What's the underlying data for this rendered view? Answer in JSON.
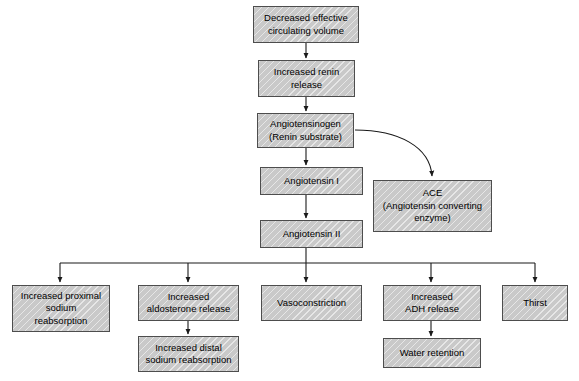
{
  "diagram": {
    "colors": {
      "node_fill": "#c9c9c9",
      "node_border": "#4d4d4d",
      "arrow": "#1a1a1a",
      "background": "#ffffff",
      "text": "#000000"
    },
    "nodes": [
      {
        "id": "decreased_volume",
        "label": "Decreased effective\ncirculating volume",
        "x": 253,
        "y": 6,
        "w": 106,
        "h": 37
      },
      {
        "id": "renin_release",
        "label": "Increased renin\nrelease",
        "x": 258,
        "y": 60,
        "w": 97,
        "h": 37
      },
      {
        "id": "angiotensinogen",
        "label": "Angiotensinogen\n(Renin substrate)",
        "x": 257,
        "y": 113,
        "w": 97,
        "h": 35
      },
      {
        "id": "angiotensin_i",
        "label": "Angiotensin I",
        "x": 260,
        "y": 167,
        "w": 103,
        "h": 28
      },
      {
        "id": "ace",
        "label": "ACE\n(Angiotensin converting\nenzyme)",
        "x": 373,
        "y": 180,
        "w": 119,
        "h": 52
      },
      {
        "id": "angiotensin_ii",
        "label": "Angiotensin II",
        "x": 260,
        "y": 220,
        "w": 103,
        "h": 28
      },
      {
        "id": "proximal_sodium",
        "label": "Increased proximal\nsodium\nreabsorption",
        "x": 12,
        "y": 285,
        "w": 98,
        "h": 47
      },
      {
        "id": "aldosterone",
        "label": "Increased\naldosterone release",
        "x": 138,
        "y": 285,
        "w": 101,
        "h": 36
      },
      {
        "id": "distal_sodium",
        "label": "Increased distal\nsodium reabsorption",
        "x": 138,
        "y": 336,
        "w": 101,
        "h": 36
      },
      {
        "id": "vasoconstriction",
        "label": "Vasoconstriction",
        "x": 261,
        "y": 285,
        "w": 101,
        "h": 36
      },
      {
        "id": "adh_release",
        "label": "Increased\nADH release",
        "x": 383,
        "y": 285,
        "w": 98,
        "h": 36
      },
      {
        "id": "water_retention",
        "label": "Water retention",
        "x": 383,
        "y": 338,
        "w": 98,
        "h": 30
      },
      {
        "id": "thirst",
        "label": "Thirst",
        "x": 502,
        "y": 285,
        "w": 66,
        "h": 36
      }
    ],
    "edges": [
      {
        "from": "decreased_volume",
        "to": "renin_release",
        "type": "straight-down"
      },
      {
        "from": "renin_release",
        "to": "angiotensinogen",
        "type": "straight-down"
      },
      {
        "from": "angiotensinogen",
        "to": "angiotensin_i",
        "type": "straight-down"
      },
      {
        "from": "angiotensinogen",
        "to": "ace",
        "type": "curved"
      },
      {
        "from": "angiotensin_i",
        "to": "angiotensin_ii",
        "type": "straight-down"
      },
      {
        "from": "angiotensin_ii",
        "to": "proximal_sodium",
        "type": "bus-branch"
      },
      {
        "from": "angiotensin_ii",
        "to": "aldosterone",
        "type": "bus-branch"
      },
      {
        "from": "angiotensin_ii",
        "to": "vasoconstriction",
        "type": "bus-branch"
      },
      {
        "from": "angiotensin_ii",
        "to": "adh_release",
        "type": "bus-branch"
      },
      {
        "from": "angiotensin_ii",
        "to": "thirst",
        "type": "bus-branch"
      },
      {
        "from": "aldosterone",
        "to": "distal_sodium",
        "type": "straight-down"
      },
      {
        "from": "adh_release",
        "to": "water_retention",
        "type": "straight-down"
      }
    ]
  }
}
